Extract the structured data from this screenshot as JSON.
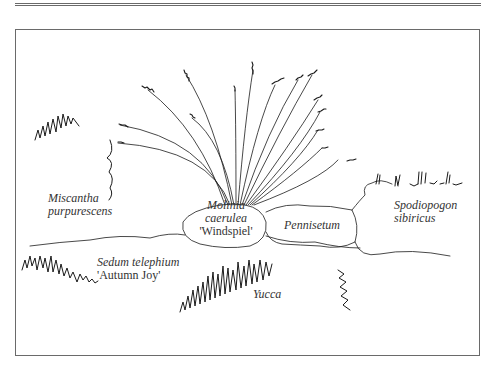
{
  "diagram": {
    "type": "planting-plan-illustration",
    "labels": {
      "miscantha": [
        "Miscantha",
        "purpurescens"
      ],
      "molinia": [
        "Molinia",
        "caerulea",
        "'Windspiel'"
      ],
      "pennisetum": "Pennisetum",
      "spodiopogon": [
        "Spodiopogon",
        "sibiricus"
      ],
      "sedum": [
        "Sedum telephium",
        "'Autumn Joy'"
      ],
      "yucca": "Yucca"
    },
    "colors": {
      "ink": "#1a1a1a",
      "frame": "#6a6a6a",
      "label": "#333333",
      "background": "#ffffff"
    }
  }
}
